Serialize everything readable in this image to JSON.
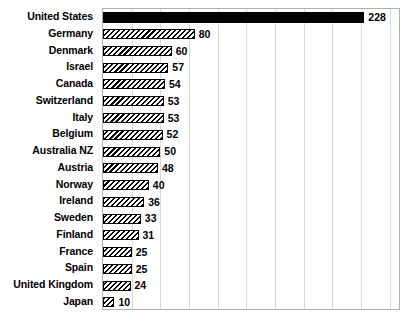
{
  "chart_data": {
    "type": "bar",
    "orientation": "horizontal",
    "title": "",
    "subtitle": "",
    "xlabel": "",
    "ylabel": "",
    "xlim": [
      0,
      260
    ],
    "grid": true,
    "gridline_interval": 25,
    "legend": "none",
    "categories": [
      "United States",
      "Germany",
      "Denmark",
      "Israel",
      "Canada",
      "Switzerland",
      "Italy",
      "Belgium",
      "Australia NZ",
      "Austria",
      "Norway",
      "Ireland",
      "Sweden",
      "Finland",
      "France",
      "Spain",
      "United Kingdom",
      "Japan"
    ],
    "values": [
      228,
      80,
      60,
      57,
      54,
      53,
      53,
      52,
      50,
      48,
      40,
      36,
      33,
      31,
      25,
      25,
      24,
      10
    ],
    "value_labels": [
      "228",
      "80",
      "60",
      "57",
      "54",
      "53",
      "53",
      "52",
      "50",
      "48",
      "40",
      "36",
      "33",
      "31",
      "25",
      "25",
      "24",
      "10"
    ],
    "bar_styles": [
      "solid-black",
      "diagonal-hatch",
      "diagonal-hatch",
      "diagonal-hatch",
      "diagonal-hatch",
      "diagonal-hatch",
      "diagonal-hatch",
      "diagonal-hatch",
      "diagonal-hatch",
      "diagonal-hatch",
      "diagonal-hatch",
      "diagonal-hatch",
      "diagonal-hatch",
      "diagonal-hatch",
      "diagonal-hatch",
      "diagonal-hatch",
      "diagonal-hatch",
      "diagonal-hatch"
    ]
  },
  "style": {
    "bar_fill": "#000000",
    "bar_outline": "#000000",
    "plot_border": "#b0b0b0",
    "gridline_color": "#d8d8d8",
    "background": "#ffffff",
    "text_color": "#000000"
  }
}
